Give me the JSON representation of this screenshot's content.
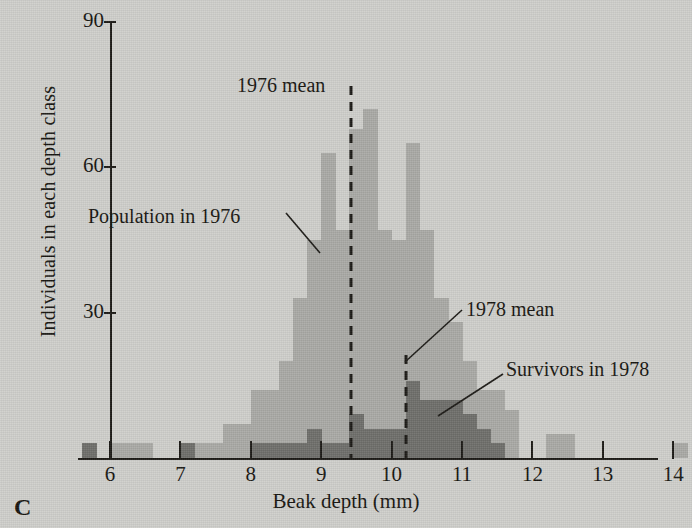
{
  "panel": {
    "letter": "C"
  },
  "labels": {
    "population_1976": "Population in 1976",
    "mean_1976": "1976 mean",
    "mean_1978": "1978 mean",
    "survivors_1978": "Survivors in 1978"
  },
  "colors": {
    "background": "#cfcfcb",
    "population_1976": "#a9a9a5",
    "survivors_1978": "#6e6e6a",
    "axis": "#1b1915",
    "text": "#16140f"
  },
  "chart_data": {
    "type": "bar",
    "title": "",
    "subtitle": "",
    "xlabel": "Beak depth (mm)",
    "ylabel": "Individuals in each depth class",
    "xlim": [
      5.55,
      14.35
    ],
    "ylim": [
      0,
      94
    ],
    "xticks": [
      6,
      7,
      8,
      9,
      10,
      11,
      12,
      13,
      14
    ],
    "yticks": [
      30,
      60,
      90
    ],
    "xtick_labels": [
      "6",
      "7",
      "8",
      "9",
      "10",
      "11",
      "12",
      "13",
      "14"
    ],
    "ytick_labels": [
      "30",
      "60",
      "90"
    ],
    "grid": false,
    "legend": "annotations",
    "bin_width": 0.2,
    "bin_starts": [
      5.6,
      5.8,
      6.0,
      6.2,
      6.4,
      6.6,
      6.8,
      7.0,
      7.2,
      7.4,
      7.6,
      7.8,
      8.0,
      8.2,
      8.4,
      8.6,
      8.8,
      9.0,
      9.2,
      9.4,
      9.6,
      9.8,
      10.0,
      10.2,
      10.4,
      10.6,
      10.8,
      11.0,
      11.2,
      11.4,
      11.6,
      11.8,
      12.0,
      12.2,
      12.4,
      12.6,
      12.8,
      13.0,
      13.2,
      13.4,
      13.6,
      13.8,
      14.0
    ],
    "series": [
      {
        "name": "Population in 1976",
        "color": "#a9a9a5",
        "values": [
          3,
          0,
          3,
          3,
          3,
          0,
          0,
          3,
          3,
          3,
          7,
          7,
          14,
          14,
          20,
          33,
          45,
          63,
          47,
          68,
          72,
          47,
          45,
          65,
          47,
          33,
          28,
          20,
          14,
          14,
          10,
          0,
          0,
          5,
          5,
          0,
          0,
          0,
          0,
          0,
          0,
          0,
          3
        ]
      },
      {
        "name": "Survivors in 1978",
        "color": "#6e6e6a",
        "values": [
          3,
          0,
          0,
          0,
          0,
          0,
          0,
          3,
          0,
          0,
          0,
          0,
          3,
          3,
          3,
          3,
          6,
          3,
          3,
          9,
          6,
          6,
          6,
          16,
          12,
          12,
          12,
          9,
          6,
          3,
          0,
          0,
          0,
          0,
          0,
          0,
          0,
          0,
          0,
          0,
          0,
          0,
          0
        ]
      }
    ],
    "annotations": [
      {
        "name": "mean-1976-line",
        "type": "vline",
        "x": 9.42,
        "label": "1976 mean",
        "style": "dashed",
        "color": "#1b1915"
      },
      {
        "name": "mean-1978-line",
        "type": "vline",
        "x": 10.2,
        "label": "1978 mean",
        "style": "dashed",
        "color": "#1b1915"
      },
      {
        "name": "population-1976-callout",
        "type": "leader",
        "label": "Population in 1976"
      },
      {
        "name": "survivors-1978-callout",
        "type": "leader",
        "label": "Survivors in 1978"
      }
    ]
  }
}
